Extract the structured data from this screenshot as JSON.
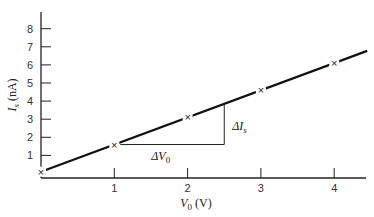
{
  "chart_data": {
    "type": "line",
    "title": "",
    "xlabel": "V0 (V)",
    "xlabel_main": "V",
    "xlabel_sub": "0",
    "xlabel_unit": " (V)",
    "ylabel": "Is (nA)",
    "ylabel_main": "I",
    "ylabel_sub": "s",
    "ylabel_unit": " (nA)",
    "x_ticks": [
      "1",
      "2",
      "3",
      "4"
    ],
    "y_ticks": [
      "1",
      "2",
      "3",
      "4",
      "5",
      "6",
      "7",
      "8"
    ],
    "xlim": [
      0,
      4.45
    ],
    "ylim": [
      0,
      8.9
    ],
    "grid": false,
    "legend": null,
    "series": [
      {
        "name": "Is vs V0",
        "x": [
          0,
          1,
          2,
          3,
          4
        ],
        "values": [
          0.1,
          1.6,
          3.1,
          4.6,
          6.1
        ],
        "marker": "x",
        "fit_line": {
          "slope": 1.5,
          "intercept": 0.1,
          "x_range": [
            0,
            4.45
          ]
        }
      }
    ],
    "annotations": [
      {
        "text": "ΔV0",
        "main": "ΔV",
        "sub": "0",
        "type": "horizontal-leg",
        "from": [
          1,
          1.6
        ],
        "to": [
          2.5,
          1.6
        ]
      },
      {
        "text": "ΔIs",
        "main": "ΔI",
        "sub": "s",
        "type": "vertical-leg",
        "from": [
          2.5,
          1.6
        ],
        "to": [
          2.5,
          3.85
        ]
      }
    ]
  }
}
